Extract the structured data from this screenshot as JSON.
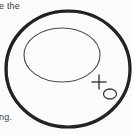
{
  "canvas": {
    "width": 133,
    "height": 134,
    "background_color": "#fdfdfd"
  },
  "text_fragments": {
    "top_left": "e the",
    "bottom_left": "ng."
  },
  "figure": {
    "ink_color": "#1c1c1c",
    "inner_ink_color": "#4a4a4a",
    "shapes": [
      {
        "name": "outer-ellipse",
        "type": "ellipse",
        "cx": 68,
        "cy": 69,
        "rx": 62,
        "ry": 58,
        "stroke": "#1c1c1c",
        "stroke_width": 3.2,
        "fill": "none"
      },
      {
        "name": "inner-ellipse",
        "type": "ellipse",
        "cx": 62,
        "cy": 55,
        "rx": 38,
        "ry": 27,
        "stroke": "#4a4a4a",
        "stroke_width": 1.1,
        "fill": "none"
      },
      {
        "name": "cross-marker",
        "type": "cross",
        "cx": 99,
        "cy": 82,
        "size": 15,
        "stroke": "#3a3a3a",
        "stroke_width": 1.4
      },
      {
        "name": "small-circle-marker",
        "type": "ellipse",
        "cx": 110,
        "cy": 94,
        "rx": 6.5,
        "ry": 5,
        "stroke": "#3a3a3a",
        "stroke_width": 1.3,
        "fill": "none"
      }
    ]
  }
}
